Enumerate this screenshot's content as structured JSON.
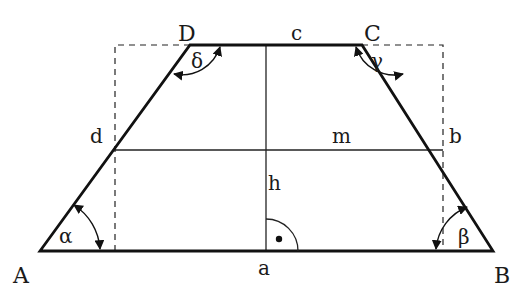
{
  "diagram": {
    "type": "trapezoid",
    "vertices": {
      "A": {
        "label": "A",
        "x": 40,
        "y": 251
      },
      "B": {
        "label": "B",
        "x": 493,
        "y": 251
      },
      "C": {
        "label": "C",
        "x": 362,
        "y": 45
      },
      "D": {
        "label": "D",
        "x": 190,
        "y": 45
      }
    },
    "sides": {
      "a": "a",
      "b": "b",
      "c": "c",
      "d": "d"
    },
    "midline": "m",
    "height": "h",
    "angles": {
      "alpha": "α",
      "beta": "β",
      "gamma": "γ",
      "delta": "δ"
    },
    "colors": {
      "line": "#111111",
      "background": "#ffffff"
    }
  }
}
